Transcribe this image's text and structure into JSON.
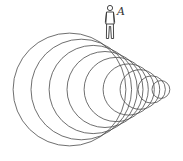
{
  "diagram": {
    "type": "wavefronts",
    "observer": {
      "label": "A",
      "x": 109,
      "y": 22
    },
    "apex": {
      "x": 178,
      "y": 89
    },
    "stroke_color": "#4a4a4a",
    "circles": [
      {
        "cx": 69.5,
        "cy": 89.5,
        "r": 56.4
      },
      {
        "cx": 81.3,
        "cy": 89.5,
        "r": 50.3
      },
      {
        "cx": 93.2,
        "cy": 89.5,
        "r": 44.1
      },
      {
        "cx": 105.0,
        "cy": 89.5,
        "r": 38.0
      },
      {
        "cx": 116.2,
        "cy": 89.5,
        "r": 32.1
      },
      {
        "cx": 128.7,
        "cy": 89.5,
        "r": 25.6
      },
      {
        "cx": 139.9,
        "cy": 89.5,
        "r": 19.8
      },
      {
        "cx": 151.7,
        "cy": 89.5,
        "r": 13.7
      },
      {
        "cx": 160.9,
        "cy": 89.5,
        "r": 8.9
      }
    ]
  }
}
